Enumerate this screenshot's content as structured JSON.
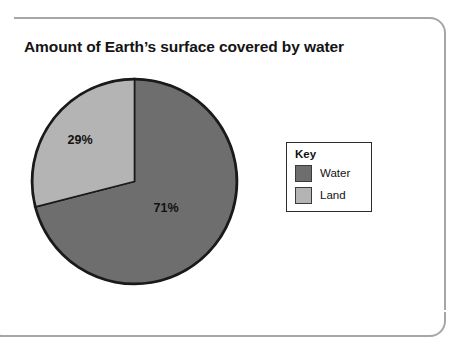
{
  "card": {
    "border_color": "#a6a6a6"
  },
  "chart_data": {
    "type": "pie",
    "title": "Amount of Earth’s surface covered by water",
    "categories": [
      "Water",
      "Land"
    ],
    "values": [
      71,
      29
    ],
    "value_labels": [
      "71%",
      "29%"
    ],
    "unit": "%",
    "colors": [
      "#6e6e6e",
      "#b4b4b4"
    ],
    "outline_color": "#1a1a1a",
    "start_angle_deg": 0,
    "direction": "clockwise",
    "legend": {
      "title": "Key",
      "position": "right",
      "entries": [
        {
          "label": "Water",
          "color": "#6e6e6e"
        },
        {
          "label": "Land",
          "color": "#b4b4b4"
        }
      ]
    },
    "xlabel": "",
    "ylabel": "",
    "grid": false
  }
}
